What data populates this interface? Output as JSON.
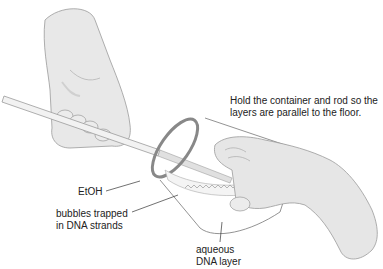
{
  "figure": {
    "instruction_line1": "Hold the container and rod so the",
    "instruction_line2": "layers are parallel to the floor.",
    "labels": {
      "etoh": "EtOH",
      "bubbles_line1": "bubbles trapped",
      "bubbles_line2": "in DNA strands",
      "aqueous_line1": "aqueous",
      "aqueous_line2": "DNA layer"
    },
    "colors": {
      "skin": "#e6e6e6",
      "skin_shadow": "#c8c8c8",
      "outline": "#8a8a8a",
      "rod": "#efefef",
      "text": "#222222"
    }
  }
}
